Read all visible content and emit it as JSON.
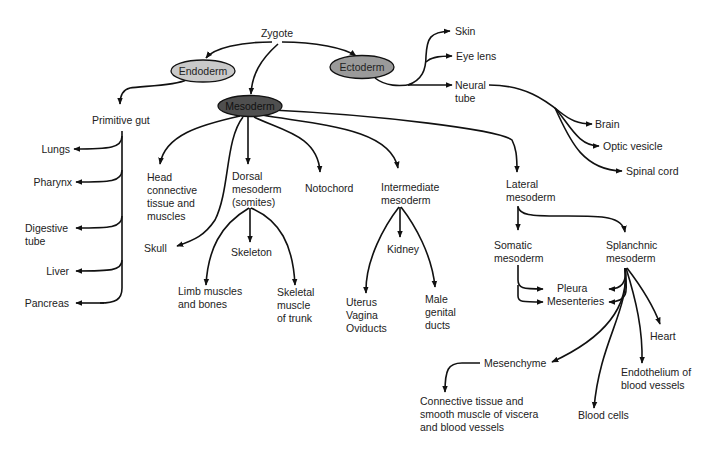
{
  "diagram": {
    "colors": {
      "endoderm_fill": "#c9c9c9",
      "ectoderm_fill": "#9a9a9a",
      "mesoderm_fill": "#4f4f4f",
      "line": "#111111",
      "text": "#222222"
    },
    "root": {
      "label": "Zygote"
    },
    "germ_layers": {
      "endoderm": {
        "label": "Endoderm"
      },
      "ectoderm": {
        "label": "Ectoderm"
      },
      "mesoderm": {
        "label": "Mesoderm"
      }
    },
    "ectoderm_derivatives": {
      "skin": "Skin",
      "eye_lens": "Eye lens",
      "neural_tube": [
        "Neural",
        "tube"
      ],
      "neural_tube_derivatives": {
        "brain": "Brain",
        "optic_vesicle": "Optic vesicle",
        "spinal_cord": "Spinal cord"
      }
    },
    "endoderm_derivatives": {
      "primitive_gut": "Primitive gut",
      "gut_derivatives": {
        "lungs": "Lungs",
        "pharynx": "Pharynx",
        "digestive_tube": [
          "Digestive",
          "tube"
        ],
        "liver": "Liver",
        "pancreas": "Pancreas"
      }
    },
    "mesoderm_derivatives": {
      "head": [
        "Head",
        "connective",
        "tissue and",
        "muscles"
      ],
      "skull": "Skull",
      "dorsal": [
        "Dorsal",
        "mesoderm",
        "(somites)"
      ],
      "dorsal_derivatives": {
        "skeleton": "Skeleton",
        "limb": [
          "Limb muscles",
          "and bones"
        ],
        "skeletal_muscle": [
          "Skeletal",
          "muscle",
          "of trunk"
        ]
      },
      "notochord": "Notochord",
      "intermediate": [
        "Intermediate",
        "mesoderm"
      ],
      "intermediate_derivatives": {
        "kidney": "Kidney",
        "uterus": [
          "Uterus",
          "Vagina",
          "Oviducts"
        ],
        "male": [
          "Male",
          "genital",
          "ducts"
        ]
      },
      "lateral": [
        "Lateral",
        "mesoderm"
      ],
      "lateral_derivatives": {
        "somatic": [
          "Somatic",
          "mesoderm"
        ],
        "splanchnic": [
          "Splanchnic",
          "mesoderm"
        ],
        "pleura": "Pleura",
        "mesenteries": "Mesenteries",
        "heart": "Heart",
        "endothelium": [
          "Endothelium of",
          "blood vessels"
        ],
        "blood_cells": "Blood cells",
        "mesenchyme": "Mesenchyme",
        "connective": [
          "Connective tissue and",
          "smooth muscle of viscera",
          "and blood vessels"
        ]
      }
    }
  }
}
